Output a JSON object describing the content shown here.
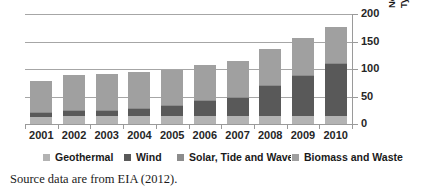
{
  "chart_data": {
    "type": "bar",
    "stacked": true,
    "title": "",
    "xlabel": "",
    "ylabel": "Non-hydroGeneration by Type (Billion kWh)",
    "ylabel_lines": [
      "Non-hydroGeneration by",
      "Type (Billion kWh)"
    ],
    "ylim": [
      0,
      200
    ],
    "yticks": [
      0,
      50,
      100,
      150,
      200
    ],
    "grid": true,
    "legend_position": "bottom",
    "categories": [
      "2001",
      "2002",
      "2003",
      "2004",
      "2005",
      "2006",
      "2007",
      "2008",
      "2009",
      "2010"
    ],
    "series": [
      {
        "name": "Geothermal",
        "color": "#b3b3b3",
        "values": [
          13,
          14,
          14,
          15,
          15,
          15,
          15,
          15,
          15,
          15
        ]
      },
      {
        "name": "Wind",
        "color": "#595959",
        "values": [
          7,
          10,
          11,
          14,
          18,
          27,
          34,
          55,
          74,
          95
        ]
      },
      {
        "name": "Solar, Tide and Wave",
        "color": "#8c8c8c",
        "values": [
          1,
          1,
          1,
          1,
          1,
          1,
          1,
          1,
          1,
          1
        ]
      },
      {
        "name": "Biomass and Waste",
        "color": "#a0a0a0",
        "values": [
          57,
          65,
          65,
          64,
          65,
          64,
          64,
          66,
          67,
          65
        ]
      }
    ],
    "totals": [
      78,
      90,
      91,
      94,
      99,
      107,
      114,
      137,
      157,
      176
    ]
  },
  "legend": {
    "items": [
      {
        "label": "Geothermal",
        "color": "#b3b3b3"
      },
      {
        "label": "Wind",
        "color": "#595959"
      },
      {
        "label": "Solar, Tide and Wave",
        "color": "#8c8c8c"
      },
      {
        "label": "Biomass and Waste",
        "color": "#a0a0a0"
      }
    ]
  },
  "caption": {
    "text": "Source data are from EIA (2012)."
  },
  "colors": {
    "gridline": "#a6a6a6",
    "axis": "#9a9a9a",
    "text": "#262626",
    "background": "#ffffff"
  }
}
